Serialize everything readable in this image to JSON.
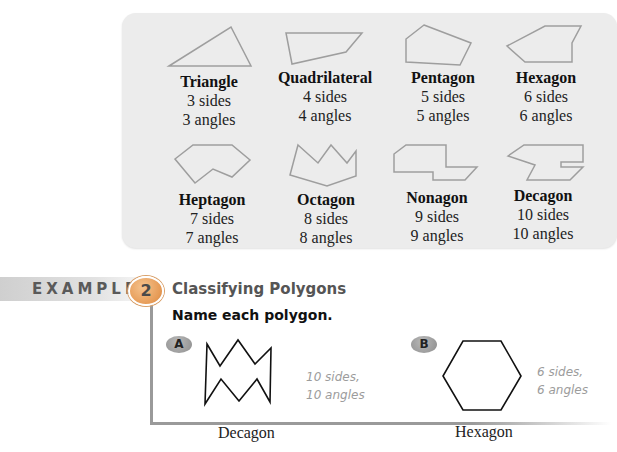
{
  "polygon_table": {
    "items": [
      {
        "name": "Triangle",
        "sides": "3 sides",
        "angles": "3 angles"
      },
      {
        "name": "Quadrilateral",
        "sides": "4 sides",
        "angles": "4 angles"
      },
      {
        "name": "Pentagon",
        "sides": "5 sides",
        "angles": "5 angles"
      },
      {
        "name": "Hexagon",
        "sides": "6 sides",
        "angles": "6 angles"
      },
      {
        "name": "Heptagon",
        "sides": "7 sides",
        "angles": "7 angles"
      },
      {
        "name": "Octagon",
        "sides": "8 sides",
        "angles": "8 angles"
      },
      {
        "name": "Nonagon",
        "sides": "9 sides",
        "angles": "9 angles"
      },
      {
        "name": "Decagon",
        "sides": "10 sides",
        "angles": "10 angles"
      }
    ]
  },
  "example": {
    "label": "EXAMPLE",
    "number": "2",
    "title": "Classifying Polygons",
    "prompt": "Name each polygon.",
    "parts": [
      {
        "badge": "A",
        "note_line1": "10 sides,",
        "note_line2": "10 angles",
        "answer": "Decagon"
      },
      {
        "badge": "B",
        "note_line1": "6 sides,",
        "note_line2": "6 angles",
        "answer": "Hexagon"
      }
    ]
  },
  "colors": {
    "panel_bg": "#ececec",
    "shape_stroke": "#9a9a9a",
    "example_number_bg": "#e69a55",
    "note_text": "#9c9c9c"
  }
}
